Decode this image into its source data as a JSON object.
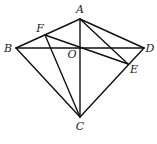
{
  "diagram": {
    "type": "geometry",
    "points": {
      "A": {
        "x": 80,
        "y": 19,
        "label": "A",
        "lx": 80,
        "ly": 13
      },
      "B": {
        "x": 16,
        "y": 48,
        "label": "B",
        "lx": 8,
        "ly": 52
      },
      "C": {
        "x": 80,
        "y": 117,
        "label": "C",
        "lx": 80,
        "ly": 130
      },
      "D": {
        "x": 144,
        "y": 48,
        "label": "D",
        "lx": 150,
        "ly": 52
      },
      "E": {
        "x": 128,
        "y": 64,
        "label": "E",
        "lx": 134,
        "ly": 73
      },
      "F": {
        "x": 45,
        "y": 35,
        "label": "F",
        "lx": 40,
        "ly": 32
      },
      "O": {
        "x": 80,
        "y": 48,
        "label": "O",
        "lx": 72,
        "ly": 58
      }
    },
    "segments": [
      [
        "A",
        "B"
      ],
      [
        "A",
        "D"
      ],
      [
        "B",
        "D"
      ],
      [
        "A",
        "C"
      ],
      [
        "B",
        "C"
      ],
      [
        "C",
        "D"
      ],
      [
        "F",
        "C"
      ],
      [
        "F",
        "E"
      ],
      [
        "A",
        "E"
      ]
    ],
    "stroke_color": "#111111",
    "label_color": "#222222"
  }
}
